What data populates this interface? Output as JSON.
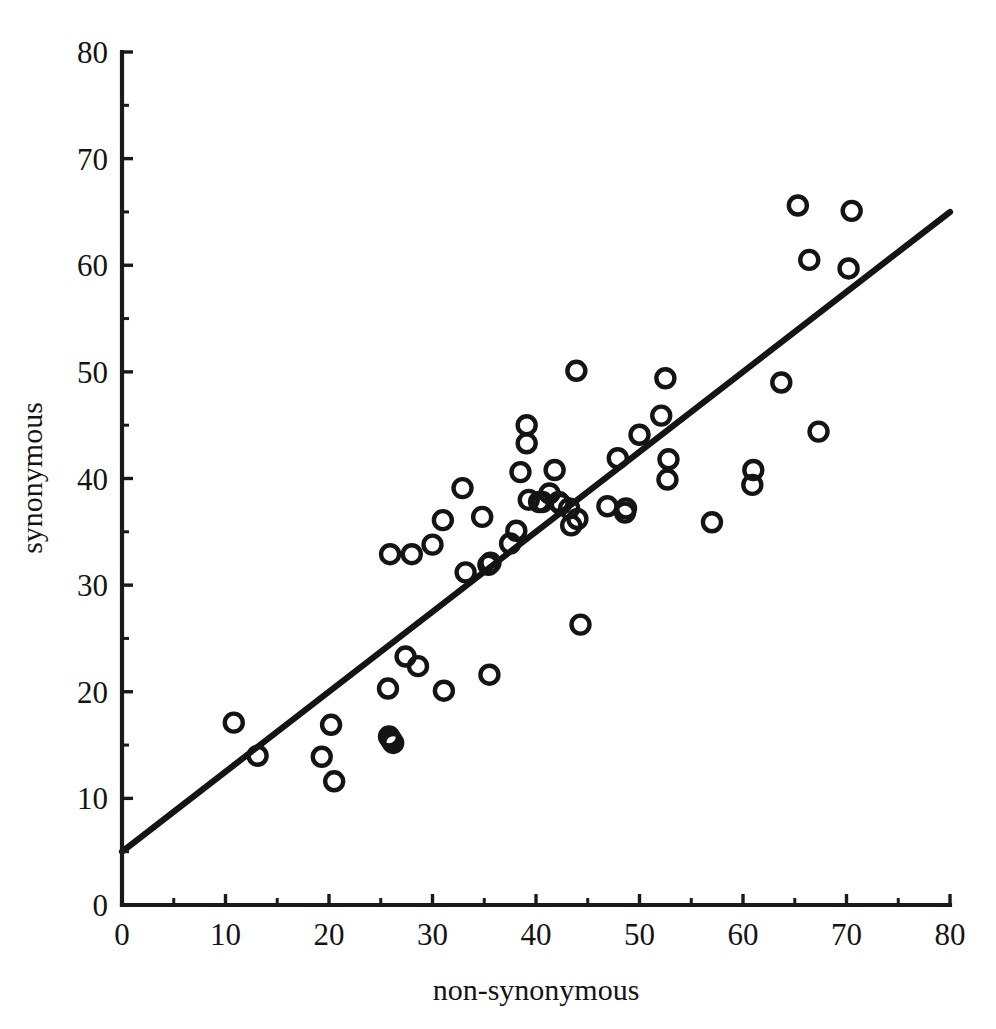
{
  "chart_data": {
    "type": "scatter",
    "title": "",
    "xlabel": "non-synonymous",
    "ylabel": "synonymous",
    "xlim": [
      0,
      80
    ],
    "ylim": [
      0,
      80
    ],
    "xticks": [
      0,
      10,
      20,
      30,
      40,
      50,
      60,
      70,
      80
    ],
    "yticks": [
      0,
      10,
      20,
      30,
      40,
      50,
      60,
      70,
      80
    ],
    "xtick_labels": [
      "0",
      "10",
      "20",
      "30",
      "40",
      "50",
      "60",
      "70",
      "80"
    ],
    "ytick_labels": [
      "0",
      "10",
      "20",
      "30",
      "40",
      "50",
      "60",
      "70",
      "80"
    ],
    "minor_tick_interval": 5,
    "grid": false,
    "legend": null,
    "marker": "open-circle",
    "marker_size": 9,
    "points": [
      {
        "x": 10.8,
        "y": 17.1
      },
      {
        "x": 13.1,
        "y": 14.0
      },
      {
        "x": 19.3,
        "y": 13.9
      },
      {
        "x": 20.2,
        "y": 16.9
      },
      {
        "x": 20.5,
        "y": 11.6
      },
      {
        "x": 25.8,
        "y": 15.8
      },
      {
        "x": 26.0,
        "y": 15.5
      },
      {
        "x": 26.2,
        "y": 15.2
      },
      {
        "x": 25.7,
        "y": 20.3
      },
      {
        "x": 27.4,
        "y": 23.3
      },
      {
        "x": 28.6,
        "y": 22.4
      },
      {
        "x": 31.1,
        "y": 20.1
      },
      {
        "x": 35.5,
        "y": 21.6
      },
      {
        "x": 25.9,
        "y": 32.9
      },
      {
        "x": 28.0,
        "y": 32.9
      },
      {
        "x": 30.0,
        "y": 33.8
      },
      {
        "x": 31.0,
        "y": 36.1
      },
      {
        "x": 33.2,
        "y": 31.2
      },
      {
        "x": 32.9,
        "y": 39.1
      },
      {
        "x": 34.8,
        "y": 36.4
      },
      {
        "x": 35.4,
        "y": 31.9
      },
      {
        "x": 35.6,
        "y": 32.1
      },
      {
        "x": 37.5,
        "y": 33.9
      },
      {
        "x": 38.1,
        "y": 35.1
      },
      {
        "x": 39.1,
        "y": 45.0
      },
      {
        "x": 39.1,
        "y": 43.3
      },
      {
        "x": 38.5,
        "y": 40.6
      },
      {
        "x": 39.3,
        "y": 38.0
      },
      {
        "x": 40.3,
        "y": 37.8
      },
      {
        "x": 40.6,
        "y": 37.8
      },
      {
        "x": 41.3,
        "y": 38.6
      },
      {
        "x": 41.8,
        "y": 40.8
      },
      {
        "x": 42.2,
        "y": 37.8
      },
      {
        "x": 42.4,
        "y": 37.6
      },
      {
        "x": 43.2,
        "y": 37.2
      },
      {
        "x": 43.4,
        "y": 35.6
      },
      {
        "x": 44.0,
        "y": 36.2
      },
      {
        "x": 43.9,
        "y": 50.1
      },
      {
        "x": 44.3,
        "y": 26.3
      },
      {
        "x": 46.9,
        "y": 37.4
      },
      {
        "x": 47.9,
        "y": 41.9
      },
      {
        "x": 48.6,
        "y": 36.8
      },
      {
        "x": 48.7,
        "y": 37.2
      },
      {
        "x": 50.0,
        "y": 44.1
      },
      {
        "x": 52.1,
        "y": 45.9
      },
      {
        "x": 52.5,
        "y": 49.4
      },
      {
        "x": 52.8,
        "y": 41.8
      },
      {
        "x": 52.7,
        "y": 39.9
      },
      {
        "x": 57.0,
        "y": 35.9
      },
      {
        "x": 60.9,
        "y": 39.4
      },
      {
        "x": 61.0,
        "y": 40.8
      },
      {
        "x": 63.7,
        "y": 49.0
      },
      {
        "x": 65.3,
        "y": 65.6
      },
      {
        "x": 66.4,
        "y": 60.5
      },
      {
        "x": 67.3,
        "y": 44.4
      },
      {
        "x": 70.2,
        "y": 59.7
      },
      {
        "x": 70.5,
        "y": 65.1
      }
    ],
    "fit_line": {
      "x_start": 0,
      "y_start": 5.0,
      "x_end": 80,
      "y_end": 65.0,
      "slope": 0.75,
      "intercept": 5.0
    }
  }
}
